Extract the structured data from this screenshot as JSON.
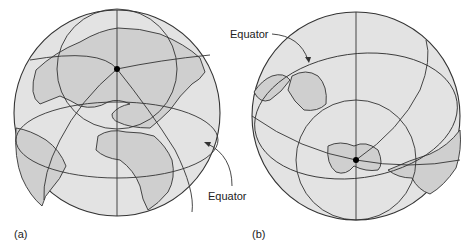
{
  "figure": {
    "panels": [
      {
        "id": "a",
        "label": "(a)",
        "annotation": "Equator",
        "view": "northern hemisphere, pole point marked",
        "pole_dot": [
          117,
          69
        ]
      },
      {
        "id": "b",
        "label": "(b)",
        "annotation": "Equator",
        "view": "southern hemisphere, pole point marked",
        "pole_dot": [
          356,
          160
        ]
      }
    ],
    "colors": {
      "globe_fill": "#e3e3e3",
      "land_fill": "#cfcfcf",
      "line": "#333333",
      "background": "#ffffff"
    }
  }
}
